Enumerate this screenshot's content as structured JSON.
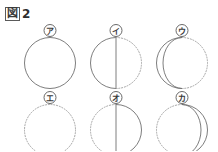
{
  "figure": {
    "marker": "図",
    "number": "2",
    "caption": "図2",
    "stroke_solid_color": "#6f6f6f",
    "stroke_dotted_color": "#9a9a9a",
    "background_color": "#ffffff"
  },
  "grid": {
    "rows": 2,
    "columns": 3
  },
  "moons": [
    {
      "label": "ア",
      "row": 1,
      "column": 1,
      "phase": "full-moon",
      "description": "完全な実線の円（満月）",
      "left_half": "solid",
      "right_half": "solid",
      "terminator": "none"
    },
    {
      "label": "イ",
      "row": 1,
      "column": 2,
      "phase": "last-quarter",
      "description": "左半分が実線、右半分が点線、中央に縦線",
      "left_half": "solid",
      "right_half": "dotted",
      "terminator": "straight-vertical"
    },
    {
      "label": "ウ",
      "row": 1,
      "column": 3,
      "phase": "waning-crescent",
      "description": "左側が三日月形の実線、右側が点線",
      "left_half": "solid",
      "right_half": "dotted",
      "terminator": "curve-bulging-right"
    },
    {
      "label": "エ",
      "row": 2,
      "column": 1,
      "phase": "new-moon",
      "description": "全体が点線の円（新月）",
      "left_half": "dotted",
      "right_half": "dotted",
      "terminator": "none"
    },
    {
      "label": "オ",
      "row": 2,
      "column": 2,
      "phase": "first-quarter",
      "description": "右半分が実線、左半分が点線、中央に縦線",
      "left_half": "dotted",
      "right_half": "solid",
      "terminator": "straight-vertical"
    },
    {
      "label": "カ",
      "row": 2,
      "column": 3,
      "phase": "waxing-crescent",
      "description": "右側が三日月形の実線、左側が点線",
      "left_half": "dotted",
      "right_half": "solid",
      "terminator": "curve-bulging-left"
    }
  ]
}
